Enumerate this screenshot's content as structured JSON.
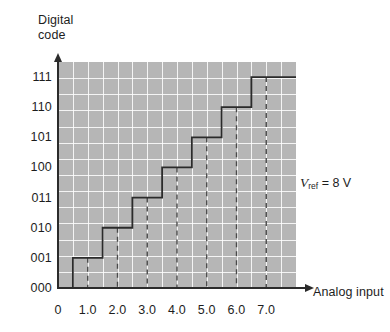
{
  "figure": {
    "y_axis_title": "Digital\ncode",
    "x_axis_title": "Analog input",
    "annotation_prefix": "V",
    "annotation_subscript": "ref",
    "annotation_suffix": " = 8 V",
    "annotation_full": "Vref = 8 V"
  },
  "chart_data": {
    "type": "line",
    "title": "",
    "subtitle": "",
    "xlabel": "Analog input",
    "ylabel": "Digital code",
    "grid": true,
    "legend": "none",
    "annotations": [
      {
        "text": "Vref = 8 V",
        "x": 8.2,
        "y": 3.4
      }
    ],
    "xlim": [
      0,
      8.0
    ],
    "ylim": [
      0,
      7.5
    ],
    "xticks": [
      0,
      1.0,
      2.0,
      3.0,
      4.0,
      5.0,
      6.0,
      7.0
    ],
    "xticklabels": [
      "0",
      "1.0",
      "2.0",
      "3.0",
      "4.0",
      "5.0",
      "6.0",
      "7.0"
    ],
    "yticks": [
      0,
      1,
      2,
      3,
      4,
      5,
      6,
      7
    ],
    "yticklabels": [
      "000",
      "001",
      "010",
      "011",
      "100",
      "101",
      "110",
      "111"
    ],
    "x_minor_step": 0.5,
    "y_minor_count": 14,
    "dashed_markers_x": [
      1.0,
      2.0,
      3.0,
      4.0,
      5.0,
      6.0,
      7.0
    ],
    "series": [
      {
        "name": "ADC transfer function",
        "style": "staircase",
        "color": "#2b2b2b",
        "points": [
          {
            "x": 0.0,
            "y": 0
          },
          {
            "x": 0.5,
            "y": 0
          },
          {
            "x": 0.5,
            "y": 1
          },
          {
            "x": 1.5,
            "y": 1
          },
          {
            "x": 1.5,
            "y": 2
          },
          {
            "x": 2.5,
            "y": 2
          },
          {
            "x": 2.5,
            "y": 3
          },
          {
            "x": 3.5,
            "y": 3
          },
          {
            "x": 3.5,
            "y": 4
          },
          {
            "x": 4.5,
            "y": 4
          },
          {
            "x": 4.5,
            "y": 5
          },
          {
            "x": 5.5,
            "y": 5
          },
          {
            "x": 5.5,
            "y": 6
          },
          {
            "x": 6.5,
            "y": 6
          },
          {
            "x": 6.5,
            "y": 7
          },
          {
            "x": 8.0,
            "y": 7
          }
        ]
      }
    ],
    "colors": {
      "plot_background": "#b6b6b6",
      "gridline": "#ffffff",
      "axis": "#2b2b2b",
      "curve": "#2b2b2b",
      "dashed_marker": "#4a4a4a",
      "page_background": "#ffffff",
      "text": "#1d1d1d"
    }
  }
}
